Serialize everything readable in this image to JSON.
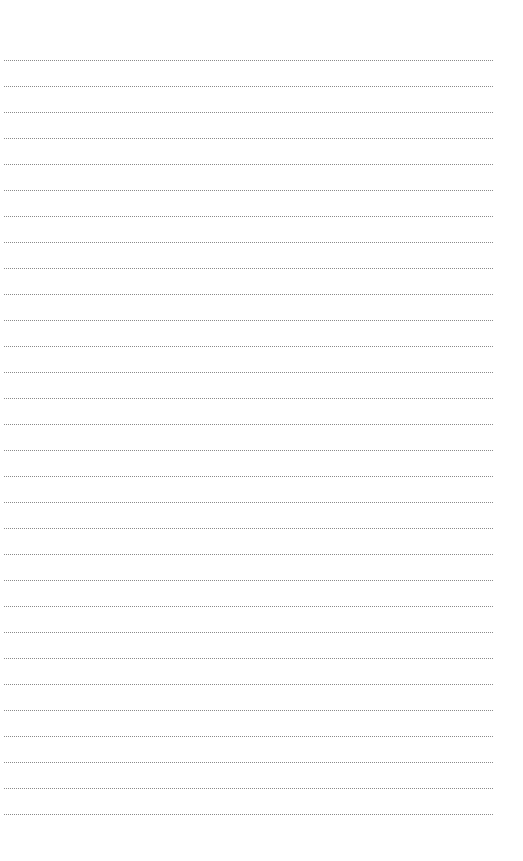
{
  "page": {
    "type": "lined-writing-sheet",
    "background_color": "#ffffff",
    "rule_color": "#8a8a8a",
    "rule_style": "dotted",
    "rule_count": 30,
    "first_rule_y": 60,
    "rule_spacing": 26,
    "rule_left": 4,
    "rule_width": 489
  }
}
